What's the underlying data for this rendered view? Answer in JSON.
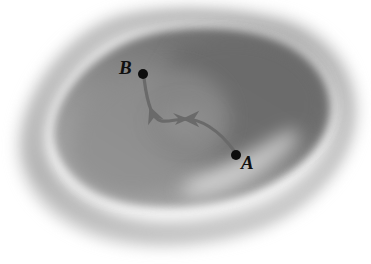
{
  "figure": {
    "kind": "shaded-region-with-path",
    "caption": "",
    "background_color": "#ffffff",
    "region": {
      "name": "shaded-blob-region",
      "outer_halo_color": "#c9c9c9",
      "rim_band_color": "#b5b5b5",
      "highlight_band_color": "#f2f2f2",
      "interior_dark_color": "#6e6e6e",
      "interior_mid_color": "#8e8e8e",
      "interior_light_color": "#b0b0b0"
    },
    "path": {
      "name": "directed-curve-A-to-B",
      "stroke_color": "#6a6a6a",
      "stroke_width": 3.2,
      "direction": "A to B",
      "arrow_position": "midpoint",
      "arrow_color": "#6a6a6a"
    },
    "points": [
      {
        "id": "B",
        "label": "B",
        "marker": "filled-dot",
        "marker_color": "#0d0d0d",
        "marker_radius": 5.0,
        "x": 143,
        "y": 74,
        "label_x": 119,
        "label_y": 58,
        "label_position": "left"
      },
      {
        "id": "A",
        "label": "A",
        "marker": "filled-dot",
        "marker_color": "#0d0d0d",
        "marker_radius": 5.0,
        "x": 236,
        "y": 155,
        "label_x": 241,
        "label_y": 153,
        "label_position": "right"
      }
    ]
  }
}
